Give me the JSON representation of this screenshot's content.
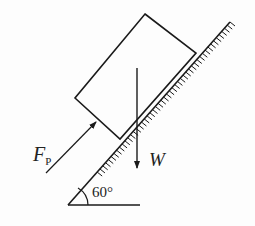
{
  "diagram": {
    "type": "free-body / inclined plane",
    "labels": {
      "force_p_main": "F",
      "force_p_sub": "P",
      "weight": "W",
      "angle": "60°"
    },
    "colors": {
      "stroke": "#1a1a1a",
      "background": "#fdfdfd"
    }
  }
}
